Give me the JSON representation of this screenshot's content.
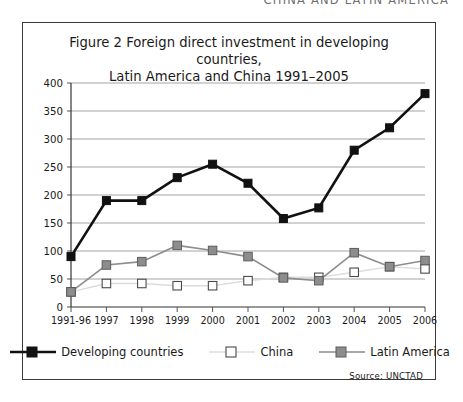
{
  "running_header": "CHINA AND LATIN AMERICA",
  "figure": {
    "title_line1": "Figure 2 Foreign direct investment in developing countries,",
    "title_line2": "Latin America and China 1991–2005",
    "source": "Source: UNCTAD"
  },
  "legend": {
    "position": "bottom-center",
    "items": [
      {
        "label": "Developing countries",
        "marker": "filled-square",
        "color": "#111111",
        "line_color": "#111111"
      },
      {
        "label": "China",
        "marker": "hollow-square",
        "color": "#ffffff",
        "line_color": "#d2d2d2"
      },
      {
        "label": "Latin America",
        "marker": "filled-square",
        "color": "#8d8d8d",
        "line_color": "#8d8d8d"
      }
    ]
  },
  "chart_data": {
    "type": "line",
    "title": "Figure 2 Foreign direct investment in developing countries, Latin America and China 1991–2005",
    "xlabel": "",
    "ylabel": "",
    "ylim": [
      0,
      400
    ],
    "ytick_step": 50,
    "yticks": [
      "0",
      "50",
      "100",
      "150",
      "200",
      "250",
      "300",
      "350",
      "400"
    ],
    "grid": "horizontal",
    "legend_position": "bottom-center",
    "source": "Source: UNCTAD",
    "categories": [
      "1991-96",
      "1997",
      "1998",
      "1999",
      "2000",
      "2001",
      "2002",
      "2003",
      "2004",
      "2005",
      "2006"
    ],
    "series": [
      {
        "name": "Developing countries",
        "color": "#111111",
        "marker": "filled-square",
        "values": [
          90,
          190,
          190,
          231,
          255,
          221,
          158,
          177,
          280,
          320,
          381
        ]
      },
      {
        "name": "China",
        "color": "#ffffff",
        "line_color": "#d2d2d2",
        "marker": "hollow-square",
        "values": [
          27,
          42,
          42,
          38,
          38,
          47,
          53,
          53,
          62,
          72,
          68
        ]
      },
      {
        "name": "Latin America",
        "color": "#8d8d8d",
        "marker": "filled-square",
        "values": [
          27,
          75,
          81,
          110,
          101,
          90,
          52,
          47,
          97,
          72,
          83
        ]
      }
    ]
  }
}
